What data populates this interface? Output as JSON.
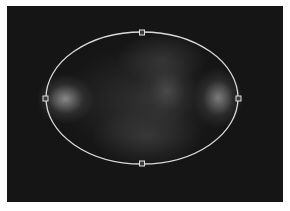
{
  "canvas": {
    "background": "#151515",
    "image": "blurred-grayscale-photo"
  },
  "selection": {
    "shape": "ellipse",
    "stroke": "#d9d9d9",
    "center": [
      142,
      98
    ],
    "rx": 96,
    "ry": 66,
    "handles": [
      {
        "name": "handle-top",
        "x": 142,
        "y": 32
      },
      {
        "name": "handle-left",
        "x": 45,
        "y": 98
      },
      {
        "name": "handle-right",
        "x": 238,
        "y": 98
      },
      {
        "name": "handle-bottom",
        "x": 142,
        "y": 163
      }
    ]
  },
  "caption": {
    "text": ""
  }
}
